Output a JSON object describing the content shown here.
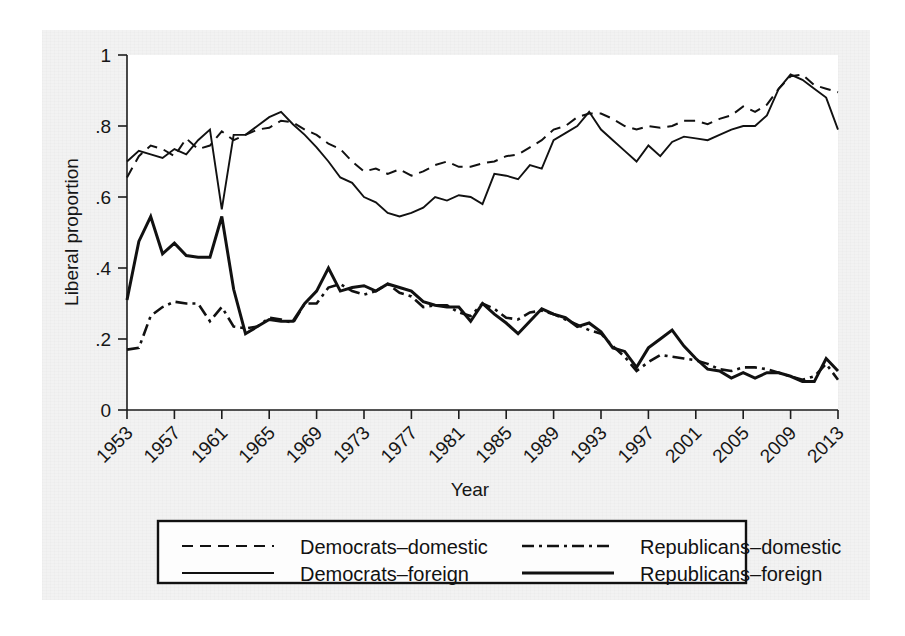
{
  "chart_data": {
    "type": "line",
    "title": "",
    "xlabel": "Year",
    "ylabel": "Liberal proportion",
    "xlim": [
      1953,
      2013
    ],
    "ylim": [
      0,
      1
    ],
    "grid": false,
    "legend_position": "bottom",
    "x_ticks": [
      1953,
      1957,
      1961,
      1965,
      1969,
      1973,
      1977,
      1981,
      1985,
      1989,
      1993,
      1997,
      2001,
      2005,
      2009,
      2013
    ],
    "x_tick_labels": [
      "1953",
      "1957",
      "1961",
      "1965",
      "1969",
      "1973",
      "1977",
      "1981",
      "1985",
      "1989",
      "1993",
      "1997",
      "2001",
      "2005",
      "2009",
      "2013"
    ],
    "y_ticks": [
      0,
      0.2,
      0.4,
      0.6,
      0.8,
      1
    ],
    "y_tick_labels": [
      "0",
      ".2",
      ".4",
      ".6",
      ".8",
      "1"
    ],
    "x": [
      1953,
      1954,
      1955,
      1956,
      1957,
      1958,
      1959,
      1960,
      1961,
      1962,
      1963,
      1964,
      1965,
      1966,
      1967,
      1968,
      1969,
      1970,
      1971,
      1972,
      1973,
      1974,
      1975,
      1976,
      1977,
      1978,
      1979,
      1980,
      1981,
      1982,
      1983,
      1984,
      1985,
      1986,
      1987,
      1988,
      1989,
      1990,
      1991,
      1992,
      1993,
      1994,
      1995,
      1996,
      1997,
      1998,
      1999,
      2000,
      2001,
      2002,
      2003,
      2004,
      2005,
      2006,
      2007,
      2008,
      2009,
      2010,
      2011,
      2012,
      2013
    ],
    "series": [
      {
        "name": "Democrats-domestic",
        "style": "dashed",
        "values": [
          0.655,
          0.715,
          0.745,
          0.735,
          0.715,
          0.765,
          0.735,
          0.745,
          0.785,
          0.76,
          0.775,
          0.79,
          0.795,
          0.815,
          0.81,
          0.79,
          0.775,
          0.75,
          0.735,
          0.7,
          0.672,
          0.68,
          0.665,
          0.678,
          0.66,
          0.672,
          0.69,
          0.7,
          0.685,
          0.685,
          0.695,
          0.7,
          0.715,
          0.72,
          0.74,
          0.76,
          0.79,
          0.8,
          0.825,
          0.835,
          0.835,
          0.82,
          0.8,
          0.79,
          0.8,
          0.795,
          0.8,
          0.815,
          0.815,
          0.805,
          0.82,
          0.83,
          0.855,
          0.84,
          0.86,
          0.905,
          0.94,
          0.945,
          0.915,
          0.905,
          0.895
        ]
      },
      {
        "name": "Democrats-foreign",
        "style": "solid",
        "values": [
          0.7,
          0.73,
          0.72,
          0.71,
          0.735,
          0.72,
          0.76,
          0.79,
          0.565,
          0.775,
          0.775,
          0.8,
          0.825,
          0.84,
          0.805,
          0.775,
          0.74,
          0.7,
          0.655,
          0.64,
          0.6,
          0.585,
          0.555,
          0.545,
          0.555,
          0.57,
          0.6,
          0.59,
          0.605,
          0.6,
          0.58,
          0.665,
          0.66,
          0.65,
          0.69,
          0.68,
          0.76,
          0.78,
          0.8,
          0.84,
          0.79,
          0.76,
          0.73,
          0.7,
          0.745,
          0.715,
          0.755,
          0.77,
          0.765,
          0.76,
          0.775,
          0.79,
          0.8,
          0.8,
          0.83,
          0.905,
          0.945,
          0.93,
          0.905,
          0.88,
          0.79
        ]
      },
      {
        "name": "Republicans-domestic",
        "style": "dash-dot",
        "values": [
          0.17,
          0.175,
          0.265,
          0.29,
          0.305,
          0.3,
          0.3,
          0.25,
          0.29,
          0.235,
          0.23,
          0.235,
          0.26,
          0.255,
          0.245,
          0.3,
          0.3,
          0.345,
          0.355,
          0.335,
          0.325,
          0.335,
          0.355,
          0.33,
          0.32,
          0.29,
          0.295,
          0.295,
          0.275,
          0.265,
          0.3,
          0.285,
          0.26,
          0.255,
          0.275,
          0.28,
          0.27,
          0.255,
          0.24,
          0.225,
          0.215,
          0.18,
          0.15,
          0.11,
          0.135,
          0.155,
          0.15,
          0.145,
          0.14,
          0.13,
          0.115,
          0.11,
          0.12,
          0.12,
          0.115,
          0.105,
          0.095,
          0.085,
          0.095,
          0.13,
          0.085
        ]
      },
      {
        "name": "Republicans-foreign",
        "style": "solid-thick",
        "values": [
          0.31,
          0.475,
          0.545,
          0.44,
          0.47,
          0.435,
          0.43,
          0.43,
          0.545,
          0.34,
          0.215,
          0.235,
          0.255,
          0.25,
          0.25,
          0.3,
          0.335,
          0.4,
          0.335,
          0.345,
          0.35,
          0.335,
          0.355,
          0.345,
          0.335,
          0.305,
          0.295,
          0.29,
          0.29,
          0.25,
          0.3,
          0.27,
          0.245,
          0.215,
          0.25,
          0.285,
          0.27,
          0.26,
          0.235,
          0.245,
          0.22,
          0.175,
          0.165,
          0.12,
          0.175,
          0.2,
          0.225,
          0.18,
          0.145,
          0.115,
          0.11,
          0.09,
          0.105,
          0.09,
          0.105,
          0.105,
          0.095,
          0.08,
          0.08,
          0.145,
          0.11
        ]
      }
    ],
    "legend": [
      {
        "name": "Democrats-domestic",
        "label": "Democrats–domestic",
        "style": "dashed"
      },
      {
        "name": "Democrats-foreign",
        "label": "Democrats–foreign",
        "style": "solid"
      },
      {
        "name": "Republicans-domestic",
        "label": "Republicans–domestic",
        "style": "dash-dot"
      },
      {
        "name": "Republicans-foreign",
        "label": "Republicans–foreign",
        "style": "solid-thick"
      }
    ]
  },
  "colors": {
    "ink": "#111111",
    "page": "#f2f2f2",
    "plot_background": "#ffffff"
  }
}
